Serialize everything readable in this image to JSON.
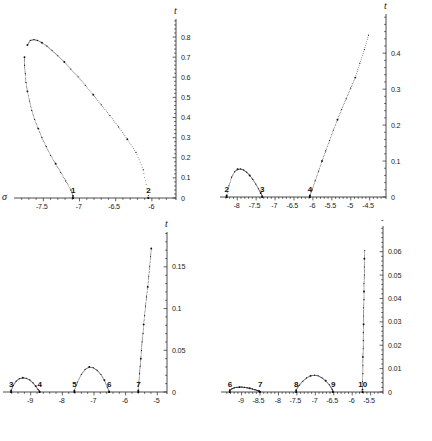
{
  "figure": {
    "type": "multi-panel-scatter",
    "panels": 4,
    "axis_labels": {
      "x": "σ",
      "y": "t"
    },
    "style": "dotted point-plot, black on white"
  },
  "chart_data": [
    {
      "panel": 1,
      "position": "top-left",
      "type": "scatter",
      "title": "",
      "xlabel": "σ",
      "ylabel": "t",
      "xlim": [
        -7.85,
        -5.75
      ],
      "ylim": [
        0,
        0.82
      ],
      "xticks": [
        -7.5,
        -7,
        -6.5,
        -6
      ],
      "xtick_labels": [
        "-7.5",
        "-7",
        "-6.5",
        "-6"
      ],
      "yticks": [
        0,
        0.1,
        0.2,
        0.3,
        0.4,
        0.5,
        0.6,
        0.7,
        0.8
      ],
      "ytick_labels": [
        "0",
        "0.1",
        "0.2",
        "0.3",
        "0.4",
        "0.5",
        "0.6",
        "0.7",
        "0.8"
      ],
      "grid": false,
      "legend": "none",
      "annotations": [
        {
          "text": "1",
          "x": -7.09,
          "y": 0.0
        },
        {
          "text": "2",
          "x": -6.05,
          "y": 0.0
        }
      ],
      "series": [
        {
          "name": "upper-branch",
          "points_x": [
            -7.72,
            -7.68,
            -7.63,
            -7.58,
            -7.52,
            -7.45,
            -7.38,
            -7.3,
            -7.21,
            -7.12,
            -7.02,
            -6.92,
            -6.81,
            -6.7,
            -6.58,
            -6.46,
            -6.34,
            -6.22,
            -6.12,
            -6.05
          ],
          "points_y": [
            0.76,
            0.783,
            0.787,
            0.783,
            0.772,
            0.755,
            0.733,
            0.707,
            0.676,
            0.641,
            0.602,
            0.56,
            0.513,
            0.463,
            0.41,
            0.353,
            0.292,
            0.227,
            0.14,
            0.012
          ]
        },
        {
          "name": "lower-branch",
          "points_x": [
            -7.76,
            -7.76,
            -7.75,
            -7.74,
            -7.72,
            -7.69,
            -7.66,
            -7.62,
            -7.57,
            -7.52,
            -7.46,
            -7.4,
            -7.33,
            -7.26,
            -7.19,
            -7.12,
            -7.09
          ],
          "points_y": [
            0.7,
            0.66,
            0.62,
            0.575,
            0.53,
            0.482,
            0.435,
            0.39,
            0.345,
            0.3,
            0.255,
            0.212,
            0.17,
            0.128,
            0.085,
            0.04,
            0.01
          ]
        }
      ]
    },
    {
      "panel": 2,
      "position": "top-right",
      "type": "scatter",
      "title": "",
      "xlabel": "σ",
      "ylabel": "t",
      "xlim": [
        -8.35,
        -4.2
      ],
      "ylim": [
        0,
        0.47
      ],
      "xticks": [
        -8,
        -7.5,
        -7,
        -6.5,
        -6,
        -5.5,
        -5,
        -4.5
      ],
      "xtick_labels": [
        "-8",
        "-7.5",
        "-7",
        "-6.5",
        "-6",
        "-5.5",
        "-5",
        "-4.5"
      ],
      "yticks": [
        0,
        0.1,
        0.2,
        0.3,
        0.4
      ],
      "ytick_labels": [
        "0",
        "0.1",
        "0.2",
        "0.3",
        "0.4"
      ],
      "grid": false,
      "legend": "none",
      "annotations": [
        {
          "text": "2",
          "x": -8.28,
          "y": 0.0
        },
        {
          "text": "3",
          "x": -7.34,
          "y": 0.0
        },
        {
          "text": "4",
          "x": -6.08,
          "y": 0.0
        }
      ],
      "series": [
        {
          "name": "arch-2-3",
          "points_x": [
            -8.28,
            -8.22,
            -8.15,
            -8.07,
            -7.99,
            -7.91,
            -7.83,
            -7.75,
            -7.67,
            -7.59,
            -7.51,
            -7.44,
            -7.38,
            -7.34
          ],
          "points_y": [
            0.004,
            0.031,
            0.055,
            0.07,
            0.077,
            0.078,
            0.075,
            0.069,
            0.06,
            0.049,
            0.036,
            0.023,
            0.011,
            0.003
          ]
        },
        {
          "name": "rising-branch-from-4",
          "points_x": [
            -6.08,
            -6.02,
            -5.94,
            -5.85,
            -5.76,
            -5.66,
            -5.56,
            -5.46,
            -5.35,
            -5.24,
            -5.12,
            -5.0,
            -4.88,
            -4.76,
            -4.64,
            -4.53
          ],
          "points_y": [
            0.004,
            0.02,
            0.045,
            0.072,
            0.1,
            0.128,
            0.157,
            0.186,
            0.215,
            0.244,
            0.273,
            0.303,
            0.332,
            0.372,
            0.41,
            0.45
          ]
        }
      ]
    },
    {
      "panel": 3,
      "position": "bottom-left",
      "type": "scatter",
      "title": "",
      "xlabel": "σ",
      "ylabel": "t",
      "xlim": [
        -9.75,
        -4.85
      ],
      "ylim": [
        0,
        0.175
      ],
      "xticks": [
        -9,
        -8,
        -7,
        -6,
        -5
      ],
      "xtick_labels": [
        "-9",
        "-8",
        "-7",
        "-6",
        "-5"
      ],
      "yticks": [
        0,
        0.05,
        0.1,
        0.15
      ],
      "ytick_labels": [
        "0",
        "0.05",
        "0.1",
        "0.15"
      ],
      "grid": false,
      "legend": "none",
      "annotations": [
        {
          "text": "3",
          "x": -9.62,
          "y": 0.0
        },
        {
          "text": "4",
          "x": -8.72,
          "y": 0.0
        },
        {
          "text": "5",
          "x": -7.62,
          "y": 0.0
        },
        {
          "text": "6",
          "x": -6.52,
          "y": 0.0
        },
        {
          "text": "7",
          "x": -5.6,
          "y": 0.0
        }
      ],
      "series": [
        {
          "name": "arch-3-4",
          "points_x": [
            -9.62,
            -9.55,
            -9.46,
            -9.36,
            -9.25,
            -9.14,
            -9.03,
            -8.93,
            -8.84,
            -8.77,
            -8.72
          ],
          "points_y": [
            0.002,
            0.008,
            0.013,
            0.016,
            0.017,
            0.0165,
            0.0145,
            0.011,
            0.007,
            0.003,
            0.001
          ]
        },
        {
          "name": "arch-5-6",
          "points_x": [
            -7.62,
            -7.52,
            -7.4,
            -7.28,
            -7.15,
            -7.02,
            -6.9,
            -6.78,
            -6.67,
            -6.58,
            -6.52
          ],
          "points_y": [
            0.002,
            0.012,
            0.021,
            0.027,
            0.03,
            0.029,
            0.026,
            0.021,
            0.014,
            0.006,
            0.001
          ]
        },
        {
          "name": "steep-branch-from-7",
          "points_x": [
            -5.6,
            -5.58,
            -5.56,
            -5.54,
            -5.52,
            -5.5,
            -5.48,
            -5.45,
            -5.43,
            -5.4,
            -5.37,
            -5.34,
            -5.3,
            -5.27,
            -5.24,
            -5.21,
            -5.19
          ],
          "points_y": [
            0.002,
            0.012,
            0.022,
            0.031,
            0.04,
            0.05,
            0.06,
            0.07,
            0.081,
            0.092,
            0.103,
            0.114,
            0.126,
            0.138,
            0.15,
            0.162,
            0.172
          ]
        }
      ]
    },
    {
      "panel": 4,
      "position": "bottom-right",
      "type": "scatter",
      "title": "",
      "xlabel": "σ",
      "ylabel": "t",
      "xlim": [
        -9.45,
        -5.3
      ],
      "ylim": [
        0,
        0.065
      ],
      "xticks": [
        -9,
        -8.5,
        -8,
        -7.5,
        -7,
        -6.5,
        -6,
        -5.5
      ],
      "xtick_labels": [
        "-9",
        "-8.5",
        "-8",
        "-7.5",
        "-7",
        "-6.5",
        "-6",
        "-5.5"
      ],
      "yticks": [
        0,
        0.01,
        0.02,
        0.03,
        0.04,
        0.05,
        0.06
      ],
      "ytick_labels": [
        "0",
        "0.01",
        "0.02",
        "0.03",
        "0.04",
        "0.05",
        "0.06"
      ],
      "grid": false,
      "legend": "none",
      "annotations": [
        {
          "text": "6",
          "x": -9.32,
          "y": 0.0
        },
        {
          "text": "7",
          "x": -8.5,
          "y": 0.0
        },
        {
          "text": "8",
          "x": -7.52,
          "y": 0.0
        },
        {
          "text": "9",
          "x": -6.52,
          "y": 0.0
        },
        {
          "text": "10",
          "x": -5.72,
          "y": 0.0
        }
      ],
      "series": [
        {
          "name": "flat-cluster-6-7",
          "points_x": [
            -9.32,
            -9.26,
            -9.2,
            -9.13,
            -9.06,
            -8.99,
            -8.92,
            -8.85,
            -8.78,
            -8.71,
            -8.64,
            -8.58,
            -8.53,
            -8.5
          ],
          "points_y": [
            0.0008,
            0.0014,
            0.0018,
            0.002,
            0.0021,
            0.0021,
            0.002,
            0.0018,
            0.0016,
            0.0013,
            0.001,
            0.0007,
            0.0004,
            0.0002
          ]
        },
        {
          "name": "arch-8-9",
          "points_x": [
            -7.52,
            -7.44,
            -7.34,
            -7.24,
            -7.13,
            -7.02,
            -6.92,
            -6.82,
            -6.72,
            -6.62,
            -6.55,
            -6.52
          ],
          "points_y": [
            0.0008,
            0.0028,
            0.0046,
            0.006,
            0.0069,
            0.0072,
            0.0069,
            0.0061,
            0.0048,
            0.0031,
            0.0013,
            0.0004
          ]
        },
        {
          "name": "vertical-branch-from-10",
          "points_x": [
            -5.72,
            -5.72,
            -5.71,
            -5.71,
            -5.71,
            -5.7,
            -5.7,
            -5.7,
            -5.69,
            -5.69,
            -5.69,
            -5.68,
            -5.68,
            -5.68,
            -5.67,
            -5.67,
            -5.67,
            -5.66
          ],
          "points_y": [
            0.001,
            0.0045,
            0.008,
            0.0115,
            0.015,
            0.0185,
            0.022,
            0.0255,
            0.029,
            0.0325,
            0.036,
            0.0395,
            0.043,
            0.0465,
            0.05,
            0.0535,
            0.057,
            0.0605
          ]
        }
      ]
    }
  ]
}
